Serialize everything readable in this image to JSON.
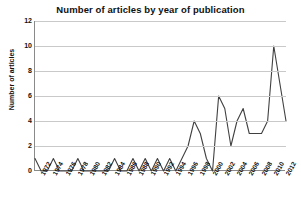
{
  "chart_data": {
    "type": "line",
    "title": "Number of articles by year of publication",
    "xlabel": "",
    "ylabel": "Number of articles",
    "ylim": [
      0,
      12
    ],
    "yticks": [
      0,
      2,
      4,
      6,
      8,
      10,
      12
    ],
    "xlim": [
      1971,
      2012
    ],
    "xticks": [
      1972,
      1974,
      1976,
      1978,
      1980,
      1982,
      1984,
      1986,
      1988,
      1990,
      1992,
      1994,
      1996,
      1998,
      2000,
      2002,
      2004,
      2006,
      2008,
      2010,
      2012
    ],
    "grid": true,
    "legend": false,
    "line_color": "#404040",
    "x": [
      1971,
      1972,
      1973,
      1974,
      1975,
      1976,
      1977,
      1978,
      1979,
      1980,
      1981,
      1982,
      1983,
      1984,
      1985,
      1986,
      1987,
      1988,
      1989,
      1990,
      1991,
      1992,
      1993,
      1994,
      1995,
      1996,
      1997,
      1998,
      1999,
      2000,
      2001,
      2002,
      2003,
      2004,
      2005,
      2006,
      2007,
      2008,
      2009,
      2010,
      2011,
      2012
    ],
    "values": [
      1,
      0,
      0,
      1,
      0,
      0,
      0,
      1,
      0,
      0,
      0,
      0,
      0,
      1,
      0,
      0,
      1,
      0,
      1,
      0,
      1,
      0,
      1,
      0,
      1,
      2,
      4,
      3,
      1,
      0,
      6,
      5,
      2,
      4,
      5,
      3,
      3,
      3,
      4,
      10,
      7,
      4
    ],
    "series": [
      {
        "name": "Number of articles",
        "values": [
          1,
          0,
          0,
          1,
          0,
          0,
          0,
          1,
          0,
          0,
          0,
          0,
          0,
          1,
          0,
          0,
          1,
          0,
          1,
          0,
          1,
          0,
          1,
          0,
          1,
          2,
          4,
          3,
          1,
          0,
          6,
          5,
          2,
          4,
          5,
          3,
          3,
          3,
          4,
          10,
          7,
          4
        ]
      }
    ]
  }
}
